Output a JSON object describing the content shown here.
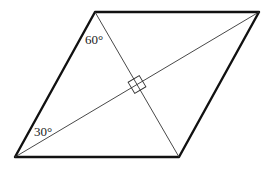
{
  "figure": {
    "shape": "rhombus",
    "vertices": {
      "top_left": [
        95,
        12
      ],
      "top_right": [
        259,
        12
      ],
      "bottom_right": [
        179,
        157
      ],
      "bottom_left": [
        15,
        157
      ]
    },
    "diagonals": [
      {
        "from": "bottom_left",
        "to": "top_right"
      },
      {
        "from": "top_left",
        "to": "bottom_right"
      }
    ],
    "intersection": [
      137,
      84.5
    ],
    "right_angle_mark": true,
    "angles": [
      {
        "label": "60°",
        "vertex": "top_left",
        "x": 85,
        "y": 44
      },
      {
        "label": "30°",
        "vertex": "bottom_left",
        "x": 34,
        "y": 136
      }
    ],
    "colors": {
      "edge": "#111111",
      "diagonal": "#333333",
      "text": "#222222"
    }
  }
}
